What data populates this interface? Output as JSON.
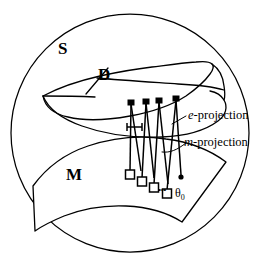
{
  "figure": {
    "background_color": "#ffffff",
    "stroke_color": "#000000",
    "width": 261,
    "height": 268
  },
  "labels": {
    "ambient_space": "S",
    "upper_manifold": "D",
    "lower_manifold": "M",
    "e_projection_italic": "e",
    "e_projection_rest": "-projection",
    "m_projection_italic": "m",
    "m_projection_rest": "-projection",
    "theta_symbol": "θ",
    "theta_subscript": "0",
    "ellipsis": "•••"
  },
  "geometry": {
    "outer_circle": {
      "shape": "circle",
      "cx": 130,
      "cy": 133,
      "r": 119
    },
    "upper_surface_D": {
      "description": "curved sheet labelled D",
      "path": "M 41 98 C 62 86 95 78 128 72 C 152 68 178 66 205 66 C 214 66 219 67 222 69 L 222 84 C 220 98 214 110 203 118 C 186 130 160 136 130 138 C 100 140 72 136 55 127 C 44 121 40 110 41 98 Z"
    },
    "lower_surface_M": {
      "description": "curved surface patch labelled M",
      "path": "M 31 185 C 50 160 82 143 120 136 C 160 129 198 135 222 150 L 185 220 C 160 208 120 206 88 212 C 66 216 50 222 38 228 Z"
    },
    "connector_count": 4,
    "connectors": [
      {
        "top_x": 131,
        "bottom_x": 129,
        "has_zigzag": true
      },
      {
        "top_x": 146,
        "bottom_x": 142,
        "has_zigzag": true
      },
      {
        "top_x": 159,
        "bottom_x": 154,
        "has_zigzag": true
      },
      {
        "top_x": 176,
        "bottom_x": 167,
        "has_zigzag": true
      }
    ],
    "theta_point": {
      "x": 180,
      "y": 177
    },
    "bracket_marker": {
      "x1": 127,
      "x2": 143,
      "y": 127
    }
  }
}
